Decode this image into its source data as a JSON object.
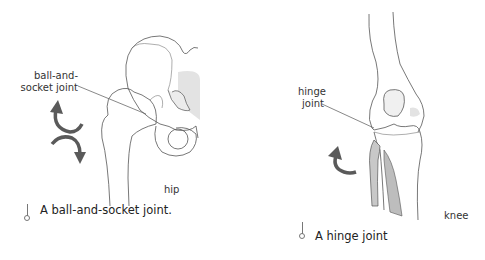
{
  "hip": {
    "callout": [
      "ball-and-",
      "socket joint"
    ],
    "name": "hip",
    "caption": "A ball-and-socket joint.",
    "arrows": [
      "counterclockwise-arrow",
      "clockwise-arrow"
    ]
  },
  "knee": {
    "callout": [
      "hinge",
      "joint"
    ],
    "name": "knee",
    "caption": "A hinge joint",
    "arrows": [
      "flex-arrow"
    ]
  },
  "colors": {
    "line": "#555555",
    "arrow": "#5a5a5a",
    "shade": "#d9d9d9",
    "text": "#222222"
  }
}
